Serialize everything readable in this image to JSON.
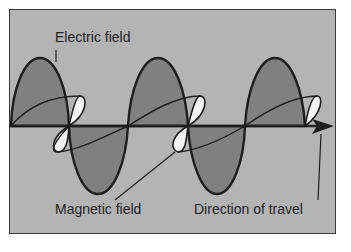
{
  "figure": {
    "type": "electromagnetic-wave-diagram",
    "colors": {
      "background": "#b4b4b4",
      "electric_lobe_fill": "#808080",
      "magnetic_lobe_fill": "#f4f4f4",
      "line": "#1e1e1e",
      "page": "#ffffff"
    },
    "labels": {
      "electric": "Electric field",
      "magnetic": "Magnetic field",
      "direction": "Direction of travel"
    }
  }
}
